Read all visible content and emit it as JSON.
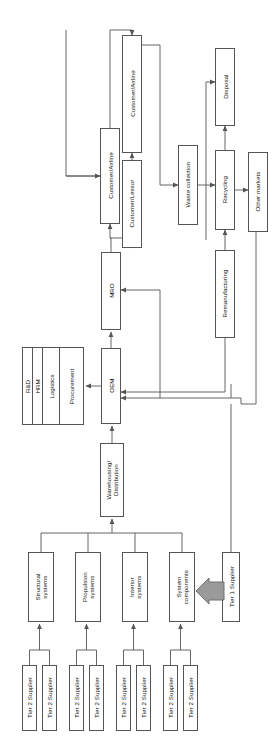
{
  "diagram": {
    "orientation": "rotated-90",
    "colors": {
      "line": "#555555",
      "box_fill": "#ffffff",
      "block_arrow_fill": "#9a9a9a",
      "block_arrow_stroke": "#6f6f6f",
      "text": "#111111"
    },
    "nodes": [
      {
        "id": "customer_airline_top",
        "label": "Customer/Airline",
        "x": 122,
        "y": 35,
        "w": 20,
        "h": 118
      },
      {
        "id": "customer_airline_left",
        "label": "Customer/Airline",
        "x": 100,
        "y": 128,
        "w": 20,
        "h": 96
      },
      {
        "id": "customer_lessor",
        "label": "Customer/Lessor",
        "x": 122,
        "y": 160,
        "w": 20,
        "h": 88
      },
      {
        "id": "waste_collection",
        "label": "Waste collection",
        "x": 178,
        "y": 145,
        "w": 20,
        "h": 80
      },
      {
        "id": "disposal",
        "label": "Disposal",
        "x": 215,
        "y": 48,
        "w": 20,
        "h": 78
      },
      {
        "id": "recycling",
        "label": "Recycling",
        "x": 215,
        "y": 150,
        "w": 20,
        "h": 80
      },
      {
        "id": "other_markets",
        "label": "Other markets",
        "x": 248,
        "y": 152,
        "w": 20,
        "h": 80
      },
      {
        "id": "remanufacturing",
        "label": "Remanufacturing",
        "x": 215,
        "y": 250,
        "w": 20,
        "h": 88
      },
      {
        "id": "mro",
        "label": "MRO",
        "x": 101,
        "y": 252,
        "w": 20,
        "h": 78
      },
      {
        "id": "oem",
        "label": "OEM",
        "x": 101,
        "y": 348,
        "w": 20,
        "h": 76
      },
      {
        "id": "warehousing",
        "label": "Warehousing/ Distribution",
        "x": 100,
        "y": 443,
        "w": 24,
        "h": 74
      },
      {
        "id": "structural_systems",
        "label": "Structural systems",
        "x": 28,
        "y": 552,
        "w": 26,
        "h": 70
      },
      {
        "id": "propulsion_systems",
        "label": "Propulsion systems",
        "x": 75,
        "y": 552,
        "w": 26,
        "h": 70
      },
      {
        "id": "interior_systems",
        "label": "Interior systems",
        "x": 122,
        "y": 552,
        "w": 26,
        "h": 70
      },
      {
        "id": "system_components",
        "label": "System components",
        "x": 169,
        "y": 552,
        "w": 26,
        "h": 70
      },
      {
        "id": "tier1_supplier",
        "label": "Tier 1 Supplier",
        "x": 222,
        "y": 552,
        "w": 18,
        "h": 70
      },
      {
        "id": "t2_1",
        "label": "Tier 2 Supplier",
        "x": 22,
        "y": 665,
        "w": 15,
        "h": 66
      },
      {
        "id": "t2_2",
        "label": "Tier 2 Supplier",
        "x": 42,
        "y": 665,
        "w": 15,
        "h": 66
      },
      {
        "id": "t2_3",
        "label": "Tier 2 Supplier",
        "x": 69,
        "y": 665,
        "w": 15,
        "h": 66
      },
      {
        "id": "t2_4",
        "label": "Tier 2 Supplier",
        "x": 89,
        "y": 665,
        "w": 15,
        "h": 66
      },
      {
        "id": "t2_5",
        "label": "Tier 2 Supplier",
        "x": 116,
        "y": 665,
        "w": 15,
        "h": 66
      },
      {
        "id": "t2_6",
        "label": "Tier 2 Supplier",
        "x": 136,
        "y": 665,
        "w": 15,
        "h": 66
      },
      {
        "id": "t2_7",
        "label": "Tier 2 Supplier",
        "x": 163,
        "y": 665,
        "w": 15,
        "h": 66
      },
      {
        "id": "t2_8",
        "label": "Tier 2 Supplier",
        "x": 183,
        "y": 665,
        "w": 15,
        "h": 66
      }
    ],
    "function_stack": {
      "id": "oem_functions",
      "x": 22,
      "y": 347,
      "w": 62,
      "h": 78,
      "cells": [
        "R&D",
        "HRM",
        "Logistics",
        "Procurement"
      ]
    },
    "block_arrow": {
      "id": "tier1-to-system-components",
      "from": "tier1_supplier",
      "to": "system_components",
      "direction": "left"
    }
  }
}
